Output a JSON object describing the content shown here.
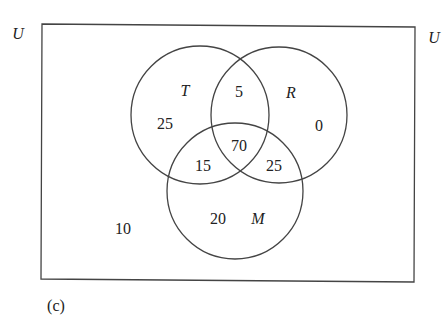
{
  "universe_label_left": "U",
  "universe_label_right": "U",
  "caption": "(c)",
  "sets": {
    "T": {
      "label": "T"
    },
    "R": {
      "label": "R"
    },
    "M": {
      "label": "M"
    }
  },
  "regions": {
    "T_only": "25",
    "T_and_R_only": "5",
    "R_only": "0",
    "T_R_M": "70",
    "T_and_M_only": "15",
    "R_and_M_only": "25",
    "M_only": "20",
    "outside": "10"
  }
}
